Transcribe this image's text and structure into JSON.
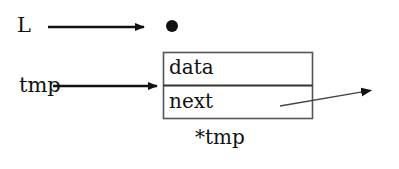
{
  "diagram": {
    "type": "pointer-diagram",
    "background_color": "#ffffff",
    "stroke_color": "#111111",
    "box_border_color": "#555555",
    "pointers": [
      {
        "name": "L",
        "label": "L",
        "target": "head-node-dot",
        "arrow": {
          "x1": 48,
          "y1": 27,
          "x2": 149,
          "y2": 27,
          "style": "solid-thick"
        }
      },
      {
        "name": "tmp",
        "label": "tmp",
        "target": "node-box",
        "arrow": {
          "x1": 53,
          "y1": 86,
          "x2": 162,
          "y2": 86,
          "style": "solid-thick"
        }
      }
    ],
    "head_dot": {
      "name": "head-node-dot",
      "cx": 172,
      "cy": 26,
      "radius": 6,
      "fill": "#111111"
    },
    "node": {
      "caption": "*tmp",
      "box": {
        "x": 163,
        "y": 52,
        "width": 150,
        "height": 67
      },
      "divider_y": 85,
      "cells": [
        {
          "name": "data",
          "label": "data"
        },
        {
          "name": "next",
          "label": "next"
        }
      ]
    },
    "next_pointer_arrow": {
      "name": "next-pointer-arrow",
      "from_cell": "next",
      "x1": 280,
      "y1": 106,
      "x2": 379,
      "y2": 89,
      "style": "solid-thin"
    }
  }
}
